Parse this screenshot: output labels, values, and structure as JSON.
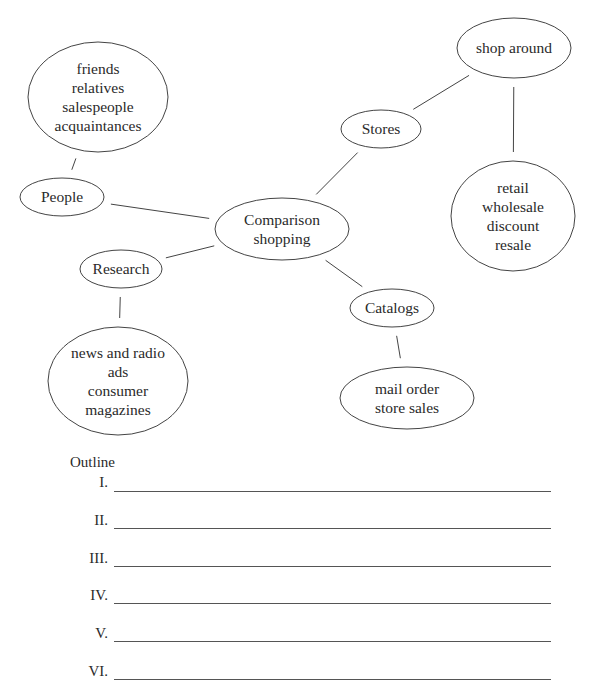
{
  "diagram": {
    "nodes": [
      {
        "id": "center",
        "lines": [
          "Comparison",
          "shopping"
        ]
      },
      {
        "id": "people",
        "lines": [
          "People"
        ]
      },
      {
        "id": "people-detail",
        "lines": [
          "friends",
          "relatives",
          "salespeople",
          "acquaintances"
        ]
      },
      {
        "id": "research",
        "lines": [
          "Research"
        ]
      },
      {
        "id": "research-detail",
        "lines": [
          "news and radio",
          "ads",
          "consumer",
          "magazines"
        ]
      },
      {
        "id": "stores",
        "lines": [
          "Stores"
        ]
      },
      {
        "id": "shop-around",
        "lines": [
          "shop around"
        ]
      },
      {
        "id": "stores-detail",
        "lines": [
          "retail",
          "wholesale",
          "discount",
          "resale"
        ]
      },
      {
        "id": "catalogs",
        "lines": [
          "Catalogs"
        ]
      },
      {
        "id": "catalogs-detail",
        "lines": [
          "mail order",
          "store sales"
        ]
      }
    ],
    "edges": [
      [
        "people",
        "people-detail"
      ],
      [
        "people",
        "center"
      ],
      [
        "research",
        "center"
      ],
      [
        "research",
        "research-detail"
      ],
      [
        "stores",
        "center"
      ],
      [
        "stores",
        "shop-around"
      ],
      [
        "shop-around",
        "stores-detail"
      ],
      [
        "catalogs",
        "center"
      ],
      [
        "catalogs",
        "catalogs-detail"
      ]
    ]
  },
  "outline": {
    "title": "Outline",
    "items": [
      "I.",
      "II.",
      "III.",
      "IV.",
      "V.",
      "VI."
    ]
  }
}
